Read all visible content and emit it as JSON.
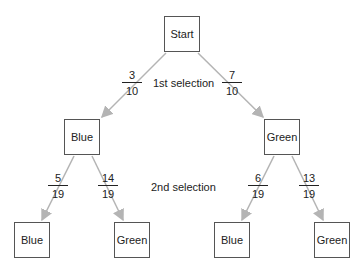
{
  "diagram": {
    "type": "probability-tree",
    "nodes": {
      "root": "Start",
      "level1": [
        "Blue",
        "Green"
      ],
      "level2": [
        "Blue",
        "Green",
        "Blue",
        "Green"
      ]
    },
    "levels": {
      "first": "1st selection",
      "second": "2nd selection"
    },
    "edges": [
      {
        "from": "Start",
        "to": "Blue",
        "num": "3",
        "den": "10"
      },
      {
        "from": "Start",
        "to": "Green",
        "num": "7",
        "den": "10"
      },
      {
        "from": "Blue",
        "to": "Blue",
        "num": "5",
        "den": "19"
      },
      {
        "from": "Blue",
        "to": "Green",
        "num": "14",
        "den": "19"
      },
      {
        "from": "Green",
        "to": "Blue",
        "num": "6",
        "den": "19"
      },
      {
        "from": "Green",
        "to": "Green",
        "num": "13",
        "den": "19"
      }
    ],
    "colors": {
      "arrow": "#b4b4b4",
      "box_border": "#555555"
    }
  }
}
